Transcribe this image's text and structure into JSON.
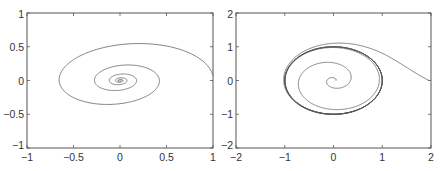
{
  "chart_data": [
    {
      "type": "line",
      "title": "",
      "xlabel": "",
      "ylabel": "",
      "xlim": [
        -1,
        1
      ],
      "ylim": [
        -1,
        1
      ],
      "xticks": [
        -1,
        -0.5,
        0,
        0.5,
        1
      ],
      "xtick_labels": [
        "−1",
        "−0.5",
        "0",
        "0.5",
        "1"
      ],
      "yticks": [
        -1,
        -0.5,
        0,
        0.5,
        1
      ],
      "ytick_labels": [
        "−1",
        "−0.5",
        "0",
        "0.5",
        "1"
      ],
      "grid": false,
      "legend": null,
      "description": "Phase-plane trajectory spiralling clockwise from (1, 0) into a stable focus at the origin",
      "series": [
        {
          "name": "trajectory",
          "kind": "spiral_sink",
          "start": [
            1,
            0
          ],
          "center": [
            0,
            0
          ],
          "decay_per_turn": 0.42,
          "turns": 5,
          "direction": "clockwise",
          "key_points": [
            [
              1,
              0
            ],
            [
              0.15,
              0.78
            ],
            [
              -0.6,
              0.1
            ],
            [
              0,
              -0.48
            ],
            [
              0.35,
              0
            ],
            [
              0,
              0.18
            ],
            [
              -0.22,
              0
            ],
            [
              0,
              0
            ]
          ]
        }
      ]
    },
    {
      "type": "line",
      "title": "",
      "xlabel": "",
      "ylabel": "",
      "xlim": [
        -2,
        2
      ],
      "ylim": [
        -2,
        2
      ],
      "xticks": [
        -2,
        -1,
        0,
        1,
        2
      ],
      "xtick_labels": [
        "−2",
        "−1",
        "0",
        "1",
        "2"
      ],
      "yticks": [
        -2,
        -1,
        0,
        1,
        2
      ],
      "ytick_labels": [
        "−2",
        "−1",
        "0",
        "1",
        "2"
      ],
      "grid": false,
      "legend": null,
      "description": "Two trajectories converging onto a stable limit cycle of radius ≈ 1: one from outside starting at (2, 0), one from inside starting near the origin",
      "series": [
        {
          "name": "outer trajectory",
          "kind": "limit_cycle_outer",
          "start": [
            2,
            0
          ],
          "cycle_radius": 1,
          "direction": "clockwise",
          "key_points": [
            [
              2,
              0
            ],
            [
              0.1,
              1.6
            ],
            [
              -1.4,
              0.1
            ],
            [
              0,
              -1.25
            ],
            [
              1.15,
              0
            ],
            [
              0,
              1.05
            ],
            [
              -1,
              0
            ]
          ]
        },
        {
          "name": "inner trajectory",
          "kind": "limit_cycle_inner",
          "start": [
            0.05,
            0
          ],
          "cycle_radius": 1,
          "direction": "clockwise",
          "key_points": [
            [
              0.05,
              0
            ],
            [
              0.2,
              0.2
            ],
            [
              -0.65,
              0
            ],
            [
              0,
              -0.8
            ],
            [
              0.9,
              0
            ],
            [
              0,
              0.97
            ],
            [
              -0.98,
              0
            ]
          ]
        }
      ]
    }
  ],
  "panels": [
    {
      "id": "left",
      "frame": {
        "x0": 27,
        "y0": 13,
        "x1": 213,
        "y1": 148
      }
    },
    {
      "id": "right",
      "frame": {
        "x0": 236,
        "y0": 13,
        "x1": 431,
        "y1": 148
      }
    }
  ],
  "colors": {
    "axis": "#555555",
    "curve": "#555555",
    "curve_dark": "#222222",
    "label": "#333333",
    "background": "#ffffff"
  }
}
